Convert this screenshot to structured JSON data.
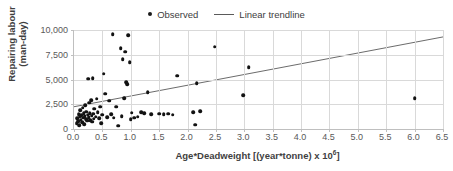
{
  "chart_data": {
    "type": "scatter",
    "title": "",
    "xlabel": "Age*Deadweight [(year*tonne) x 10^6]",
    "xlabel_main": "Age*Deadweight [(year*tonne) x 10",
    "xlabel_sup": "6",
    "xlabel_tail": "]",
    "ylabel": "Repairing labour (man-day)",
    "ylabel_line1": "Repairing labour",
    "ylabel_line2": "(man-day)",
    "xlim": [
      0,
      6.5
    ],
    "ylim": [
      0,
      10000
    ],
    "grid": true,
    "legend_position": "top-center",
    "xticks": [
      "0.0",
      "0.5",
      "1.0",
      "1.5",
      "2.0",
      "2.5",
      "3.0",
      "3.5",
      "4.0",
      "4.5",
      "5.0",
      "5.5",
      "6.0",
      "6.5"
    ],
    "xtick_values": [
      0,
      0.5,
      1.0,
      1.5,
      2.0,
      2.5,
      3.0,
      3.5,
      4.0,
      4.5,
      5.0,
      5.5,
      6.0,
      6.5
    ],
    "yticks": [
      "0",
      "2,500",
      "5,000",
      "7,500",
      "10,000"
    ],
    "ytick_values": [
      0,
      2500,
      5000,
      7500,
      10000
    ],
    "marker_color": "#121212",
    "trendline_color": "#5a5a5a",
    "gridline_color": "#d9d9d9",
    "axis_color": "#bfbfbf",
    "series": [
      {
        "name": "Observed",
        "type": "scatter",
        "points": [
          [
            0.05,
            600
          ],
          [
            0.06,
            1100
          ],
          [
            0.07,
            800
          ],
          [
            0.08,
            1500
          ],
          [
            0.09,
            400
          ],
          [
            0.1,
            1250
          ],
          [
            0.11,
            1900
          ],
          [
            0.12,
            950
          ],
          [
            0.13,
            1400
          ],
          [
            0.14,
            700
          ],
          [
            0.15,
            2150
          ],
          [
            0.16,
            1150
          ],
          [
            0.17,
            1600
          ],
          [
            0.18,
            500
          ],
          [
            0.19,
            1300
          ],
          [
            0.2,
            2400
          ],
          [
            0.21,
            1000
          ],
          [
            0.22,
            1750
          ],
          [
            0.23,
            850
          ],
          [
            0.24,
            1450
          ],
          [
            0.25,
            5100
          ],
          [
            0.26,
            1200
          ],
          [
            0.27,
            2650
          ],
          [
            0.28,
            1600
          ],
          [
            0.29,
            900
          ],
          [
            0.3,
            2900
          ],
          [
            0.31,
            1350
          ],
          [
            0.32,
            750
          ],
          [
            0.33,
            5150
          ],
          [
            0.34,
            1550
          ],
          [
            0.35,
            1050
          ],
          [
            0.36,
            2050
          ],
          [
            0.38,
            1250
          ],
          [
            0.4,
            3050
          ],
          [
            0.42,
            1700
          ],
          [
            0.44,
            1100
          ],
          [
            0.46,
            2250
          ],
          [
            0.48,
            600
          ],
          [
            0.5,
            1450
          ],
          [
            0.52,
            5600
          ],
          [
            0.55,
            3550
          ],
          [
            0.58,
            1200
          ],
          [
            0.62,
            2850
          ],
          [
            0.66,
            1500
          ],
          [
            0.68,
            9550
          ],
          [
            0.7,
            1150
          ],
          [
            0.74,
            2250
          ],
          [
            0.78,
            350
          ],
          [
            0.82,
            8150
          ],
          [
            0.84,
            1300
          ],
          [
            0.86,
            7050
          ],
          [
            0.88,
            3100
          ],
          [
            0.9,
            7800
          ],
          [
            0.92,
            4700
          ],
          [
            0.94,
            4550
          ],
          [
            0.96,
            9500
          ],
          [
            0.98,
            6750
          ],
          [
            1.0,
            1000
          ],
          [
            1.02,
            1650
          ],
          [
            1.06,
            1150
          ],
          [
            1.12,
            1250
          ],
          [
            1.18,
            1700
          ],
          [
            1.24,
            1600
          ],
          [
            1.3,
            3700
          ],
          [
            1.36,
            1500
          ],
          [
            1.5,
            1550
          ],
          [
            1.58,
            1500
          ],
          [
            1.66,
            1550
          ],
          [
            1.74,
            1450
          ],
          [
            1.82,
            5400
          ],
          [
            2.1,
            1700
          ],
          [
            2.14,
            450
          ],
          [
            2.16,
            4600
          ],
          [
            2.22,
            1800
          ],
          [
            2.48,
            8300
          ],
          [
            2.98,
            3400
          ],
          [
            3.08,
            6250
          ],
          [
            6.0,
            3100
          ]
        ]
      },
      {
        "name": "Linear trendline",
        "type": "line",
        "x_start": 0,
        "y_start": 2250,
        "x_end": 6.5,
        "y_end": 9300
      }
    ]
  },
  "legend": {
    "items": [
      {
        "label": "Observed",
        "marker": "dot"
      },
      {
        "label": "Linear trendline",
        "marker": "line"
      }
    ]
  }
}
